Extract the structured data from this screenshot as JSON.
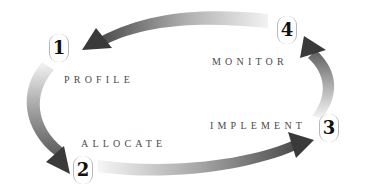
{
  "diagram": {
    "type": "cycle",
    "steps": [
      {
        "number": "1",
        "label": "PROFILE"
      },
      {
        "number": "2",
        "label": "ALLOCATE"
      },
      {
        "number": "3",
        "label": "IMPLEMENT"
      },
      {
        "number": "4",
        "label": "MONITOR"
      }
    ],
    "flow": [
      "1 → 2",
      "2 → 3",
      "3 → 4",
      "4 → 1"
    ],
    "colors": {
      "arrow_dark": "#3c3c3c",
      "arrow_light": "#f2f2f2",
      "badge_border": "#b8b8b8",
      "number_text": "#111111",
      "label_text": "#4a4a4a",
      "background": "#ffffff"
    }
  }
}
